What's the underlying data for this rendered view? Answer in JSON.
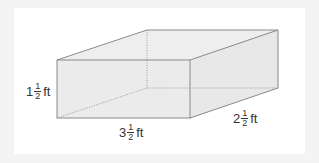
{
  "diagram": {
    "type": "rectangular-prism",
    "colors": {
      "background": "#f4f4f4",
      "panel": "#ffffff",
      "face_fill": "#ebebeb",
      "edge": "#8a8a8a",
      "hidden_edge": "#9a9a9a",
      "text": "#333333"
    },
    "dimensions": {
      "height": {
        "whole": "1",
        "numerator": "1",
        "denominator": "2",
        "unit": "ft"
      },
      "length": {
        "whole": "3",
        "numerator": "1",
        "denominator": "2",
        "unit": "ft"
      },
      "width": {
        "whole": "2",
        "numerator": "1",
        "denominator": "2",
        "unit": "ft"
      }
    }
  }
}
